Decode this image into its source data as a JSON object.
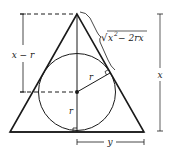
{
  "diagram": {
    "labels": {
      "slant_length": "√x² − 2rx",
      "slant_sqrt": "√",
      "slant_x": "x",
      "slant_sup": "2",
      "slant_rest": " − 2rx",
      "apex_to_center": "x − r",
      "radius_tangent": "r",
      "radius_vertical": "r",
      "height": "x",
      "half_base": "y"
    },
    "colors": {
      "stroke": "#1a1a1a",
      "background": "#ffffff"
    }
  }
}
